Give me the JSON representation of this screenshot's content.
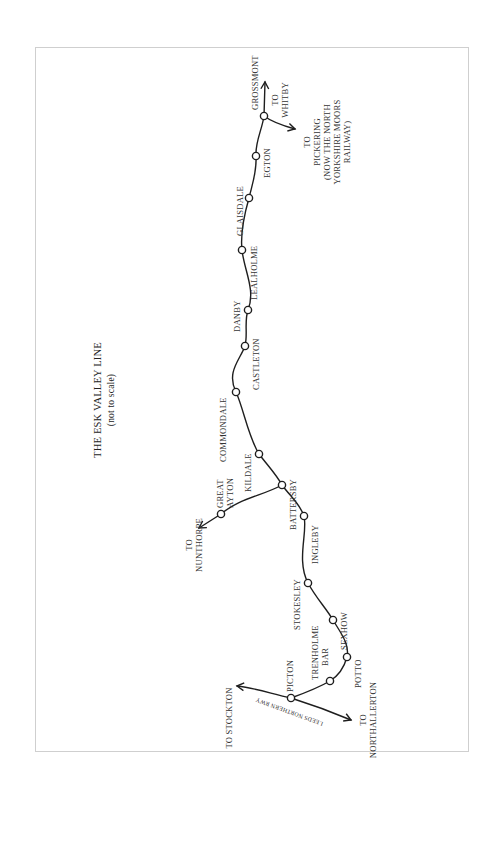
{
  "diagram": {
    "title": "THE ESK VALLEY LINE",
    "subtitle": "(not to scale)",
    "line_color": "#1e1e1e",
    "frame_color": "#cfcfcf",
    "stations": [
      {
        "name": "GROSSMONT",
        "x": 264,
        "y": 116
      },
      {
        "name": "EGTON",
        "x": 256,
        "y": 156
      },
      {
        "name": "GLAISDALE",
        "x": 249,
        "y": 198
      },
      {
        "name": "LEALHOLME",
        "x": 242,
        "y": 250
      },
      {
        "name": "DANBY",
        "x": 248,
        "y": 310
      },
      {
        "name": "CASTLETON",
        "x": 245,
        "y": 346
      },
      {
        "name": "COMMONDALE",
        "x": 236,
        "y": 392
      },
      {
        "name": "KILDALE",
        "x": 259,
        "y": 454
      },
      {
        "name": "BATTERSBY",
        "x": 282,
        "y": 485
      },
      {
        "name": "GREAT AYTON",
        "x": 221,
        "y": 514
      },
      {
        "name": "INGLEBY",
        "x": 304,
        "y": 516
      },
      {
        "name": "STOKESLEY",
        "x": 308,
        "y": 583
      },
      {
        "name": "SEXHOW",
        "x": 333,
        "y": 620
      },
      {
        "name": "POTTO",
        "x": 347,
        "y": 657
      },
      {
        "name": "TRENHOLME BAR",
        "x": 330,
        "y": 681
      },
      {
        "name": "PICTON",
        "x": 291,
        "y": 698
      }
    ],
    "labels": {
      "grossmont": "GROSSMONT",
      "egton": "EGTON",
      "glaisdale": "GLAISDALE",
      "lealholme": "LEALHOLME",
      "danby": "DANBY",
      "castleton": "CASTLETON",
      "commondale": "COMMONDALE",
      "kildale": "KILDALE",
      "battersby": "BATTERSBY",
      "great_ayton_1": "GREAT",
      "great_ayton_2": "AYTON",
      "ingleby": "INGLEBY",
      "stokesley": "STOKESLEY",
      "sexhow": "SEXHOW",
      "potto": "POTTO",
      "trenholme_1": "TRENHOLME",
      "trenholme_2": "BAR",
      "picton": "PICTON"
    },
    "destinations": {
      "whitby_1": "TO",
      "whitby_2": "WHITBY",
      "pickering_1": "TO",
      "pickering_2": "PICKERING",
      "pickering_3": "(NOW THE NORTH",
      "pickering_4": "YORKSHIRE MOORS",
      "pickering_5": "RAILWAY)",
      "nunthorpe_1": "TO",
      "nunthorpe_2": "NUNTHORPE",
      "stockton": "TO STOCKTON",
      "northallerton_1": "TO",
      "northallerton_2": "NORTHALLERTON"
    },
    "branch_label": "LEEDS NORTHERN RWY"
  }
}
